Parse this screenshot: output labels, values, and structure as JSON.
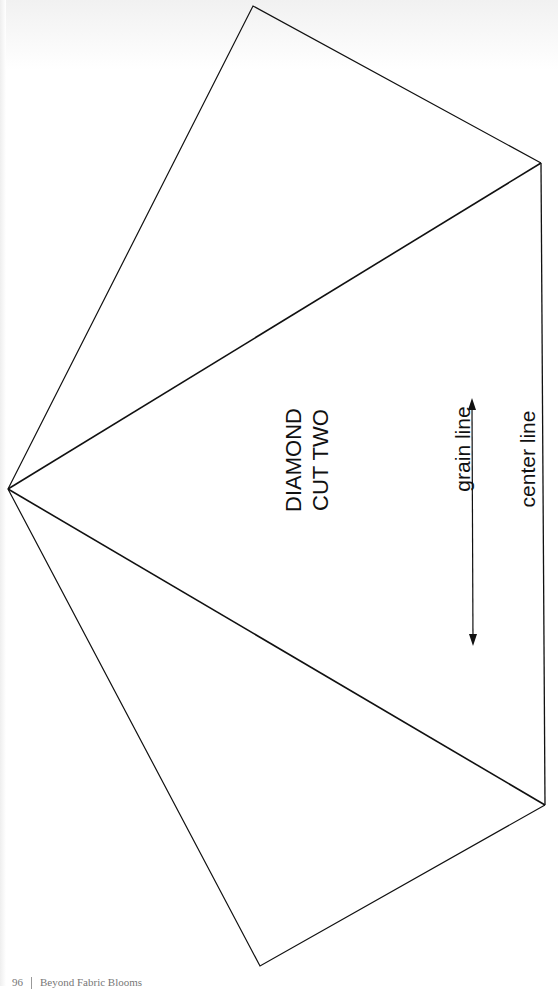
{
  "pattern": {
    "title_line1": "DIAMOND",
    "title_line2": "CUT TWO",
    "grain_label": "grain line",
    "center_label": "center line",
    "stroke_color": "#111111"
  },
  "footer": {
    "page_number": "96",
    "book_title": "Beyond Fabric Blooms"
  }
}
